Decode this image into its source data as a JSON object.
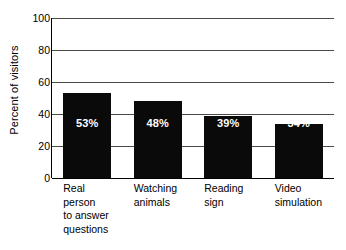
{
  "chart_data": {
    "type": "bar",
    "title": "",
    "xlabel": "",
    "ylabel": "Percent of visitors",
    "categories": [
      "Real\nperson\nto answer\nquestions",
      "Watching\nanimals",
      "Reading\nsign",
      "Video\nsimulation"
    ],
    "values": [
      53,
      48,
      39,
      34
    ],
    "data_labels": [
      "53%",
      "48%",
      "39%",
      "34%"
    ],
    "ylim": [
      0,
      100
    ],
    "yticks": [
      0,
      20,
      40,
      60,
      80,
      100
    ],
    "ytick_labels": [
      "0",
      "20",
      "40",
      "60",
      "80",
      "100"
    ],
    "grid": true,
    "legend": "none",
    "bar_color": "#0A0A0A",
    "data_label_color": "#FFFFFF",
    "gridline_color": "#4A4A4A",
    "axis_color": "#000000",
    "background_color": "#FFFFFF"
  }
}
